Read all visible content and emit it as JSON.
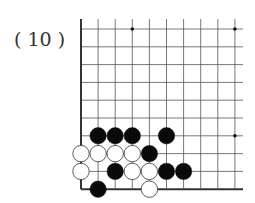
{
  "problem": {
    "label": "( 10 )"
  },
  "board": {
    "origin_x": 81,
    "origin_y": 29,
    "spacing_x": 17.1,
    "spacing_y": 17.8,
    "cols": 10,
    "rows": 10,
    "right_open_extent": 243,
    "top_open_extent": 19,
    "edges": [
      "left",
      "bottom"
    ],
    "line_color": "#555555",
    "edge_color": "#333333",
    "star_points": [
      {
        "col": 3,
        "row": 0
      },
      {
        "col": 9,
        "row": 0
      },
      {
        "col": 9,
        "row": 6
      }
    ],
    "stones": [
      {
        "color": "black",
        "col": 1,
        "row": 6
      },
      {
        "color": "black",
        "col": 2,
        "row": 6
      },
      {
        "color": "black",
        "col": 3,
        "row": 6
      },
      {
        "color": "black",
        "col": 5,
        "row": 6
      },
      {
        "color": "white",
        "col": 0,
        "row": 7
      },
      {
        "color": "white",
        "col": 1,
        "row": 7
      },
      {
        "color": "white",
        "col": 2,
        "row": 7
      },
      {
        "color": "white",
        "col": 3,
        "row": 7
      },
      {
        "color": "black",
        "col": 4,
        "row": 7
      },
      {
        "color": "white",
        "col": 0,
        "row": 8
      },
      {
        "color": "black",
        "col": 2,
        "row": 8
      },
      {
        "color": "white",
        "col": 3,
        "row": 8
      },
      {
        "color": "white",
        "col": 4,
        "row": 8
      },
      {
        "color": "black",
        "col": 5,
        "row": 8
      },
      {
        "color": "black",
        "col": 6,
        "row": 8
      },
      {
        "color": "black",
        "col": 1,
        "row": 9
      },
      {
        "color": "white",
        "col": 4,
        "row": 9
      }
    ]
  }
}
